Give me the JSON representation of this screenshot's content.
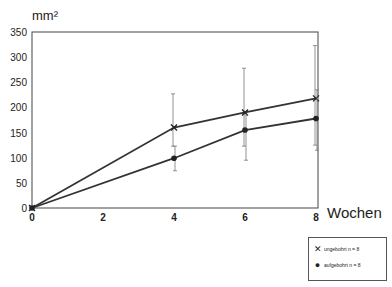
{
  "chart_data": {
    "type": "line",
    "title": "",
    "xlabel": "Wochen",
    "ylabel": "mm²",
    "x": [
      0,
      4,
      6,
      8
    ],
    "xticks": [
      0,
      2,
      4,
      6,
      8
    ],
    "yticks": [
      0,
      50,
      100,
      150,
      200,
      250,
      300,
      350
    ],
    "xlim": [
      0,
      8
    ],
    "ylim": [
      0,
      350
    ],
    "grid": false,
    "legend_position": "bottom-right outside",
    "series": [
      {
        "name": "ungebohrt n = 8",
        "marker": "x",
        "values": [
          0,
          160,
          190,
          218
        ],
        "err_upper": [
          0,
          227,
          278,
          323
        ],
        "err_lower": [
          0,
          123,
          123,
          125
        ]
      },
      {
        "name": "aufgebohrt n = 8",
        "marker": "filled-circle",
        "values": [
          0,
          99,
          155,
          178
        ],
        "err_upper": [
          0,
          123,
          185,
          235
        ],
        "err_lower": [
          0,
          74,
          95,
          115
        ]
      }
    ]
  },
  "labels": {
    "ylabel": "mm²",
    "xlabel": "Wochen"
  },
  "legend": {
    "items": [
      {
        "label": "ungebohrt n = 8",
        "symbol": "✕"
      },
      {
        "label": "aufgebohrt n = 8",
        "symbol": "●"
      }
    ]
  }
}
